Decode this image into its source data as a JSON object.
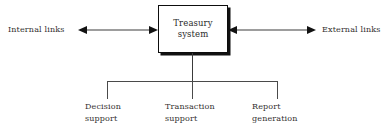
{
  "diagram": {
    "center_node": {
      "name": "treasury-system-node",
      "line1": "Treasury",
      "line2": "system"
    },
    "left": {
      "label": "Internal links",
      "arrow": "double-headed-arrow-left"
    },
    "right": {
      "label": "External links",
      "arrow": "double-headed-arrow-right"
    },
    "children": [
      {
        "line1": "Decision",
        "line2": "support"
      },
      {
        "line1": "Transaction",
        "line2": "support"
      },
      {
        "line1": "Report",
        "line2": "generation"
      }
    ],
    "colors": {
      "background": "#ffffff",
      "node_border": "#0d0d0d",
      "node_shadow": "#111111",
      "connector": "#4a4a4a",
      "text": "#33302f"
    }
  }
}
